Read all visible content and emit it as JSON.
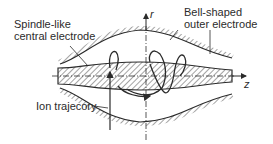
{
  "diagram": {
    "labels": {
      "central_electrode": [
        "Spindle-like",
        "central electrode"
      ],
      "outer_electrode": [
        "Bell-shaped",
        "outer electrode"
      ],
      "ion_trajectory": "Ion trajecory"
    },
    "axes": {
      "radial": "r",
      "axial": "z"
    },
    "colors": {
      "line": "#2b2b2b",
      "hatch": "#555555",
      "background": "#ffffff"
    }
  }
}
